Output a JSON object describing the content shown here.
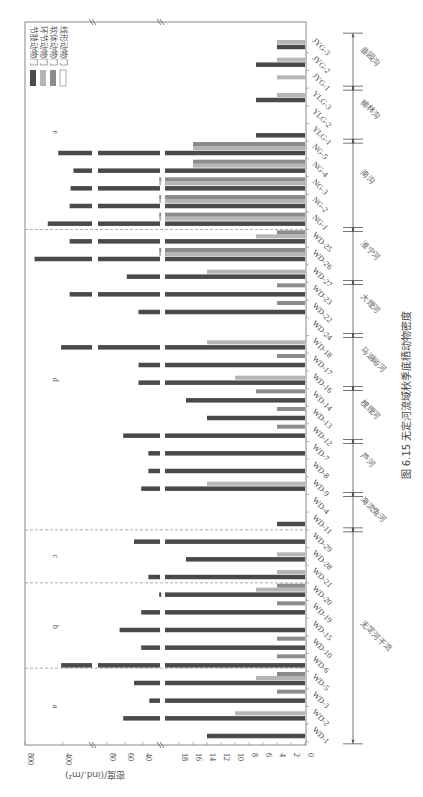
{
  "caption": "图 6.15  无定河流域秋季底栖动物密度",
  "colors": {
    "arthropoda": "#4a4a4a",
    "annelida": "#b5b5b5",
    "mollusca": "#8c8c8c",
    "nematoda": "#ffffff",
    "axis": "#888888",
    "divider": "#777777"
  },
  "chart_data": {
    "type": "bar",
    "orientation": "grouped bars, figure rotated 90° clockwise (value axis runs right-to-left along bottom)",
    "title": "无定河流域秋季底栖动物密度",
    "xlabel": "",
    "ylabel": "密度/(ind./m²)",
    "axis_break": true,
    "value_ticks": [
      "0",
      "2",
      "4",
      "6",
      "8",
      "10",
      "12",
      "14",
      "16",
      "18",
      "40",
      "60",
      "80",
      "400",
      "800"
    ],
    "legend": [
      "节肢动物门",
      "环节动物门",
      "软体动物门",
      "线形动物门"
    ],
    "legend_position": "top-left (rotated)",
    "categories": [
      "WD-1",
      "WD-2",
      "WD-3",
      "WD-5",
      "WD-6",
      "WD-10",
      "WD-15",
      "WD-19",
      "WD-20",
      "WD-21",
      "WD-28",
      "WD-29",
      "WD-11",
      "WD-4",
      "WD-9",
      "WD-8",
      "WD-7",
      "WD-12",
      "WD-13",
      "WD-14",
      "WD-16",
      "WD-17",
      "WD-18",
      "WD-24",
      "WD-22",
      "WD-23",
      "WD-27",
      "WD-26",
      "WD-25",
      "NG-1",
      "NG-2",
      "NG-3",
      "NG-4",
      "NG-5",
      "YLG-1",
      "YLG-2",
      "YLG-3",
      "JYG-1",
      "JYG-2",
      "JYG-3"
    ],
    "series": [
      {
        "name": "节肢动物门",
        "values": [
          14,
          62,
          33,
          50,
          420,
          42,
          66,
          42,
          22,
          34,
          17,
          50,
          4,
          0,
          42,
          34,
          34,
          62,
          14,
          17,
          45,
          45,
          420,
          0,
          45,
          330,
          58,
          700,
          330,
          560,
          330,
          320,
          290,
          450,
          7,
          0,
          7,
          0,
          7,
          4
        ]
      },
      {
        "name": "环节动物门",
        "values": [
          0,
          10,
          0,
          7,
          0,
          0,
          0,
          0,
          7,
          4,
          4,
          0,
          0,
          0,
          14,
          0,
          0,
          0,
          0,
          0,
          10,
          0,
          14,
          0,
          0,
          0,
          14,
          22,
          7,
          22,
          22,
          22,
          16,
          16,
          0,
          0,
          4,
          4,
          4,
          4
        ]
      },
      {
        "name": "软体动物门",
        "values": [
          0,
          0,
          4,
          4,
          4,
          4,
          0,
          4,
          4,
          0,
          0,
          0,
          0,
          0,
          0,
          0,
          0,
          4,
          4,
          7,
          0,
          4,
          0,
          0,
          4,
          4,
          0,
          22,
          4,
          22,
          22,
          22,
          16,
          16,
          0,
          0,
          0,
          0,
          0,
          0
        ]
      },
      {
        "name": "线形动物门",
        "values": [
          0,
          0,
          0,
          0,
          0,
          0,
          0,
          0,
          0,
          0,
          0,
          0,
          0,
          0,
          0,
          0,
          0,
          0,
          0,
          0,
          0,
          0,
          0,
          0,
          0,
          0,
          0,
          0,
          0,
          0,
          0,
          0,
          0,
          0,
          0,
          0,
          0,
          0,
          0,
          0
        ]
      }
    ],
    "panels": [
      {
        "letter": "a",
        "from": "WD-1",
        "to": "WD-5"
      },
      {
        "letter": "b",
        "from": "WD-6",
        "to": "WD-20"
      },
      {
        "letter": "c",
        "from": "WD-21",
        "to": "WD-29"
      },
      {
        "letter": "d",
        "from": "WD-11",
        "to": "WD-25"
      },
      {
        "letter": "e",
        "from": "NG-1",
        "to": "JYG-3"
      }
    ],
    "groups": [
      {
        "label": "无定河干流",
        "from": "WD-1",
        "to": "WD-29"
      },
      {
        "label": "海流兔河",
        "from": "WD-11",
        "to": "WD-4"
      },
      {
        "label": "芦河",
        "from": "WD-9",
        "to": "WD-7"
      },
      {
        "label": "槐理河",
        "from": "WD-12",
        "to": "WD-14"
      },
      {
        "label": "马湖峪河",
        "from": "WD-16",
        "to": "WD-18"
      },
      {
        "label": "大理河",
        "from": "WD-24",
        "to": "WD-23"
      },
      {
        "label": "淮宁河",
        "from": "WD-27",
        "to": "WD-25"
      },
      {
        "label": "南沟",
        "from": "NG-1",
        "to": "NG-5"
      },
      {
        "label": "榆林沟",
        "from": "YLG-1",
        "to": "YLG-3"
      },
      {
        "label": "韭园沟",
        "from": "JYG-1",
        "to": "JYG-3"
      }
    ]
  }
}
